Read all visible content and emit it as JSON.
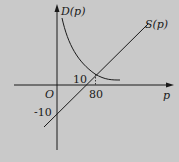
{
  "diagram": {
    "type": "supply-demand",
    "y_axis_label": "D(p)",
    "x_axis_label": "p",
    "origin_label": "O",
    "supply_label": "S(p)",
    "intersection_y_label": "10",
    "intersection_x_label": "80",
    "y_intercept_label": "-10",
    "colors": {
      "background": "#c9c9c9",
      "ink": "#1a1a1a"
    }
  }
}
